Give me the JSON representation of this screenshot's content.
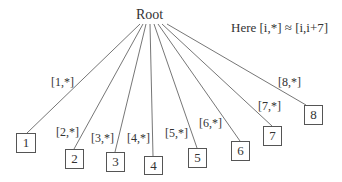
{
  "root": {
    "label": "Root"
  },
  "note": {
    "text": "Here [i,*] ≈ [i,i+7]"
  },
  "edges": [
    {
      "label": "[1,*]"
    },
    {
      "label": "[2,*]"
    },
    {
      "label": "[3,*]"
    },
    {
      "label": "[4,*]"
    },
    {
      "label": "[5,*]"
    },
    {
      "label": "[6,*]"
    },
    {
      "label": "[7,*]"
    },
    {
      "label": "[8,*]"
    }
  ],
  "leaves": [
    {
      "label": "1"
    },
    {
      "label": "2"
    },
    {
      "label": "3"
    },
    {
      "label": "4"
    },
    {
      "label": "5"
    },
    {
      "label": "6"
    },
    {
      "label": "7"
    },
    {
      "label": "8"
    }
  ],
  "colors": {
    "line": "#555555",
    "text": "#333333"
  }
}
